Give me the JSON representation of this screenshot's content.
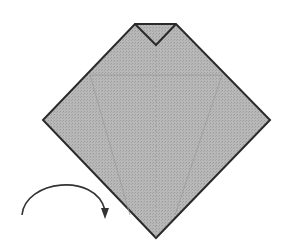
{
  "diagram": {
    "type": "origami-step",
    "colors": {
      "paper": "#b4b4b4",
      "outline": "#2a2a2a",
      "crease": "#9a9a9a",
      "background": "#ffffff",
      "arrow": "#333333"
    },
    "shape": {
      "description": "Square folded into diamond with top corner folded down forming a small V notch",
      "points": [
        [
          135,
          24
        ],
        [
          176,
          24
        ],
        [
          270,
          120
        ],
        [
          156,
          238
        ],
        [
          43,
          120
        ]
      ],
      "notch": [
        [
          135,
          24
        ],
        [
          156,
          45
        ],
        [
          176,
          24
        ]
      ]
    },
    "creases": [
      {
        "from": [
          90,
          75
        ],
        "to": [
          222,
          75
        ]
      },
      {
        "from": [
          90,
          75
        ],
        "to": [
          130,
          215
        ]
      },
      {
        "from": [
          222,
          75
        ],
        "to": [
          175,
          215
        ]
      },
      {
        "from": [
          156,
          45
        ],
        "to": [
          156,
          238
        ]
      }
    ],
    "arrow": {
      "meaning": "turn-over",
      "path": "M22,215 C25,180 95,170 105,210",
      "head": [
        105,
        218
      ]
    }
  }
}
